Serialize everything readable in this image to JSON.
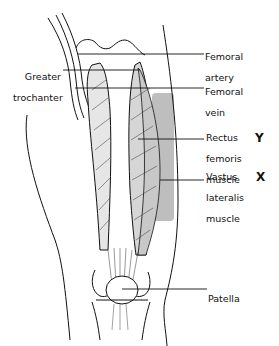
{
  "diagram": {
    "labels": {
      "femoral_artery": [
        "Femoral",
        "artery"
      ],
      "greater_trochanter": [
        "Greater",
        "trochanter"
      ],
      "femoral_vein": [
        "Femoral",
        "vein"
      ],
      "rectus_femoris": [
        "Rectus",
        "femoris",
        "muscle"
      ],
      "vastus_lateralis": [
        "Vastus",
        "lateralis",
        "muscle"
      ],
      "patella": [
        "Patella"
      ]
    },
    "markers": {
      "rectus_femoris": "Y",
      "vastus_lateralis": "X"
    },
    "colors": {
      "line": "#111111",
      "shade": "#a8a8a8",
      "background": "#ffffff"
    }
  }
}
